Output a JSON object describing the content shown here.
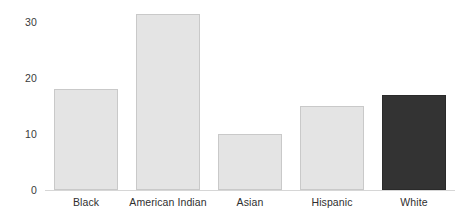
{
  "chart_data": {
    "type": "bar",
    "title": "",
    "subtitle": "",
    "xlabel": "",
    "ylabel": "",
    "categories": [
      "Black",
      "American Indian",
      "Asian",
      "Hispanic",
      "White"
    ],
    "values": [
      18,
      31.5,
      10,
      15,
      17
    ],
    "series": [
      {
        "name": "",
        "values": [
          18,
          31.5,
          10,
          15,
          17
        ]
      }
    ],
    "ylim": [
      0,
      33
    ],
    "xlim": [
      0,
      5
    ],
    "y_ticks": [
      0,
      10,
      20,
      30
    ],
    "y_tick_labels": [
      "0",
      "10",
      "20",
      "30"
    ],
    "x_tick_labels": [
      "Black",
      "American Indian",
      "Asian",
      "Hispanic",
      "White"
    ],
    "grid": false,
    "legend": null,
    "legend_position": "none",
    "annotations": [],
    "bar_colors": [
      "#e4e4e4",
      "#e4e4e4",
      "#e4e4e4",
      "#e4e4e4",
      "#333333"
    ],
    "bar_edge_colors": [
      "#c9c9c9",
      "#c9c9c9",
      "#c9c9c9",
      "#c9c9c9",
      "#2a2a2a"
    ],
    "highlighted_category": "White",
    "background_color": "#ffffff",
    "axis_label_color": "#2f2f2f"
  },
  "axis": {
    "y_labels": [
      {
        "text": "30",
        "value": 30
      },
      {
        "text": "20",
        "value": 20
      },
      {
        "text": "10",
        "value": 10
      },
      {
        "text": "0",
        "value": 0
      }
    ]
  },
  "bars": [
    {
      "label": "Black",
      "value": 18,
      "color": "#e4e4e4",
      "style": "light"
    },
    {
      "label": "American Indian",
      "value": 31.5,
      "color": "#e4e4e4",
      "style": "light"
    },
    {
      "label": "Asian",
      "value": 10,
      "color": "#e4e4e4",
      "style": "light"
    },
    {
      "label": "Hispanic",
      "value": 15,
      "color": "#e4e4e4",
      "style": "light"
    },
    {
      "label": "White",
      "value": 17,
      "color": "#333333",
      "style": "dark"
    }
  ]
}
